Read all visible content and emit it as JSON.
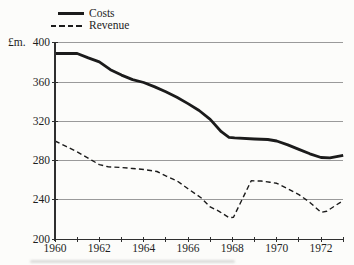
{
  "figure": {
    "unit_label": "£m.",
    "legend": {
      "costs_label": "Costs",
      "revenue_label": "Revenue"
    }
  },
  "chart_data": {
    "type": "line",
    "ylabel": "£m.",
    "xlabel": "",
    "x_range": [
      1960,
      1973
    ],
    "y_range": [
      200,
      400
    ],
    "y_ticks": [
      400,
      360,
      320,
      280,
      240,
      200
    ],
    "x_tick_years": [
      1960,
      1961,
      1962,
      1963,
      1964,
      1965,
      1966,
      1967,
      1968,
      1969,
      1970,
      1971,
      1972,
      1973
    ],
    "x_labels": [
      {
        "year": 1960,
        "label": "1960"
      },
      {
        "year": 1962,
        "label": "1962"
      },
      {
        "year": 1964,
        "label": "1964"
      },
      {
        "year": 1966,
        "label": "1966"
      },
      {
        "year": 1968,
        "label": "1968"
      },
      {
        "year": 1970,
        "label": "1970"
      },
      {
        "year": 1972,
        "label": "1972"
      }
    ],
    "grid": "horizontal",
    "legend_position": "top-left",
    "categories": [
      1960,
      1961,
      1962,
      1963,
      1964,
      1965,
      1966,
      1967,
      1968,
      1969,
      1970,
      1971,
      1972,
      1973
    ],
    "series": [
      {
        "name": "Costs",
        "line_style": "solid",
        "stroke_width": 2.8,
        "values": [
          389,
          389,
          380,
          367,
          360,
          350,
          338,
          322,
          304,
          302,
          300,
          291,
          283,
          285
        ],
        "points": [
          [
            1960,
            389
          ],
          [
            1961,
            389
          ],
          [
            1961.5,
            384.5
          ],
          [
            1962,
            380.5
          ],
          [
            1962.5,
            372.5
          ],
          [
            1963,
            367
          ],
          [
            1963.5,
            362.5
          ],
          [
            1964,
            359.5
          ],
          [
            1964.5,
            355
          ],
          [
            1965,
            350
          ],
          [
            1965.5,
            344.5
          ],
          [
            1966,
            338
          ],
          [
            1966.5,
            331
          ],
          [
            1967,
            322
          ],
          [
            1967.5,
            309.5
          ],
          [
            1967.85,
            303.8
          ],
          [
            1968.1,
            303.2
          ],
          [
            1969,
            302
          ],
          [
            1969.6,
            301.5
          ],
          [
            1970,
            300
          ],
          [
            1970.5,
            296
          ],
          [
            1971,
            291.5
          ],
          [
            1971.5,
            287
          ],
          [
            1972,
            283.2
          ],
          [
            1972.4,
            282.8
          ],
          [
            1973,
            285.5
          ]
        ]
      },
      {
        "name": "Revenue",
        "line_style": "dashed",
        "stroke_width": 1.4,
        "values": [
          300,
          289,
          276,
          273,
          271,
          265,
          251,
          233,
          222,
          259,
          257,
          245,
          228,
          239
        ],
        "points": [
          [
            1960,
            300
          ],
          [
            1960.5,
            294.5
          ],
          [
            1961,
            289
          ],
          [
            1961.65,
            280.5
          ],
          [
            1962,
            276
          ],
          [
            1962.4,
            273.8
          ],
          [
            1963,
            273
          ],
          [
            1963.5,
            272
          ],
          [
            1964,
            271
          ],
          [
            1964.6,
            269
          ],
          [
            1965,
            264.5
          ],
          [
            1965.5,
            259.5
          ],
          [
            1966,
            251.5
          ],
          [
            1966.6,
            242
          ],
          [
            1967,
            233
          ],
          [
            1967.4,
            228.5
          ],
          [
            1967.85,
            222
          ],
          [
            1968.05,
            222.5
          ],
          [
            1968.85,
            259.5
          ],
          [
            1969.3,
            259.3
          ],
          [
            1969.7,
            258
          ],
          [
            1970,
            257
          ],
          [
            1970.5,
            251.5
          ],
          [
            1971,
            245.5
          ],
          [
            1971.5,
            237.5
          ],
          [
            1972,
            227.5
          ],
          [
            1972.25,
            228.5
          ],
          [
            1973,
            239.5
          ]
        ]
      }
    ],
    "colors": {
      "line": "#1b1b1b",
      "grid": "#8f8f8f",
      "axis": "#2f2f2f",
      "text": "#1e1e1e",
      "background": "#fcfcfa"
    }
  }
}
